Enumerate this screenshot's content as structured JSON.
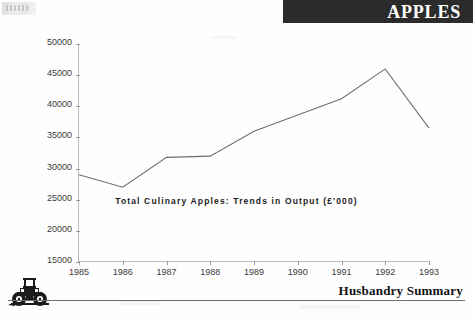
{
  "header": {
    "title": "APPLES",
    "banner_color": "#2b2b2b",
    "text_color": "#ffffff"
  },
  "footer": {
    "title": "Husbandry Summary",
    "icon": "tractor-icon",
    "rule_color": "#6d6d6d"
  },
  "chart_data": {
    "type": "line",
    "title": "Total Culinary Apples: Trends in Output (£'000)",
    "annotation": "Total Culinary Apples: Trends in Output (£'000)",
    "xlabel": "",
    "ylabel": "",
    "categories": [
      "1985",
      "1986",
      "1987",
      "1988",
      "1989",
      "1990",
      "1991",
      "1992",
      "1993"
    ],
    "values": [
      29000,
      27000,
      31800,
      32000,
      36000,
      38600,
      41200,
      46000,
      36500
    ],
    "ylim": [
      15000,
      50000
    ],
    "ytick_labels": [
      "50000",
      "45000",
      "40000",
      "35000",
      "30000",
      "25000",
      "20000",
      "15000"
    ],
    "ytick_values": [
      50000,
      45000,
      40000,
      35000,
      30000,
      25000,
      20000,
      15000
    ],
    "grid": false,
    "legend": "none",
    "line_color": "#6e6e6e",
    "axis_color": "#b9b9b9",
    "series": [
      {
        "name": "Total Culinary Apples",
        "values": [
          29000,
          27000,
          31800,
          32000,
          36000,
          38600,
          41200,
          46000,
          36500
        ]
      }
    ]
  }
}
